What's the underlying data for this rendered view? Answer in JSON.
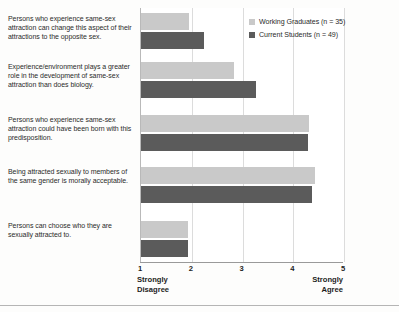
{
  "chart_data": {
    "type": "bar",
    "orientation": "horizontal",
    "title": "",
    "xlabel": "",
    "ylabel": "",
    "xlim": [
      1,
      5
    ],
    "xticks": [
      "1",
      "2",
      "3",
      "4",
      "5"
    ],
    "grid": true,
    "scale_low_label": "Strongly\nDisagree",
    "scale_high_label": "Strongly\nAgree",
    "legend_position": "top-right",
    "categories": [
      "Persons who experience same-sex attraction can change this aspect of their attractions to the opposite sex.",
      "Experience/environment plays a greater role in the development of same-sex attraction than does biology.",
      "Persons who experience same-sex attraction could have been born with this predisposition.",
      "Being attracted sexually to members of the same gender is morally acceptable.",
      "Persons can choose who they are sexually attracted to."
    ],
    "series": [
      {
        "name": "Working Graduates (n = 35)",
        "color": "#c9c9c9",
        "values": [
          1.95,
          2.83,
          4.32,
          4.42,
          1.93
        ]
      },
      {
        "name": "Current Students (n = 49)",
        "color": "#5b5b5b",
        "values": [
          2.25,
          3.27,
          4.3,
          4.37,
          1.92
        ]
      }
    ]
  },
  "legend": {
    "items": [
      {
        "label": "Working Graduates (n = 35)",
        "swatch": "light"
      },
      {
        "label": "Current Students (n = 49)",
        "swatch": "dark"
      }
    ]
  },
  "axis": {
    "ticks": [
      "1",
      "2",
      "3",
      "4",
      "5"
    ],
    "low_label": "Strongly\nDisagree",
    "high_label": "Strongly\nAgree"
  }
}
